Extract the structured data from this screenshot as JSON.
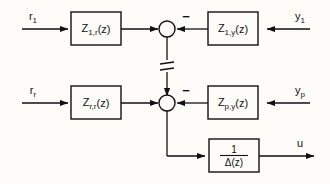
{
  "diagram": {
    "background_color": "#fdfcf8",
    "line_color": "#111111",
    "inputs": [
      {
        "id": "r1",
        "base": "r",
        "sub": "1",
        "row": "top"
      },
      {
        "id": "rr",
        "base": "r",
        "sub": "r",
        "row": "middle"
      },
      {
        "id": "y1",
        "base": "y",
        "sub": "1",
        "row": "top"
      },
      {
        "id": "yp",
        "base": "y",
        "sub": "p",
        "row": "middle"
      }
    ],
    "outputs": [
      {
        "id": "u",
        "base": "u",
        "sub": "",
        "row": "bottom"
      }
    ],
    "blocks": [
      {
        "id": "z1r",
        "base": "Z",
        "sub": "1,r",
        "arg": "(z)",
        "row": "top",
        "side": "left"
      },
      {
        "id": "z1y",
        "base": "Z",
        "sub": "1,y",
        "arg": "(z)",
        "row": "top",
        "side": "right"
      },
      {
        "id": "zrr",
        "base": "Z",
        "sub": "r,r",
        "arg": "(z)",
        "row": "middle",
        "side": "left"
      },
      {
        "id": "zpy",
        "base": "Z",
        "sub": "p,y",
        "arg": "(z)",
        "row": "middle",
        "side": "right"
      },
      {
        "id": "delta",
        "type": "fraction",
        "numerator": "1",
        "denominator": "Δ(z)",
        "row": "bottom",
        "side": "right"
      }
    ],
    "summing_junctions": [
      {
        "id": "sum-top",
        "row": "top",
        "sign_right": "−"
      },
      {
        "id": "sum-middle",
        "row": "middle",
        "sign_right": "−"
      }
    ],
    "break_symbol": {
      "id": "vertical-break",
      "meaning": "omitted-intermediate-stages"
    }
  }
}
